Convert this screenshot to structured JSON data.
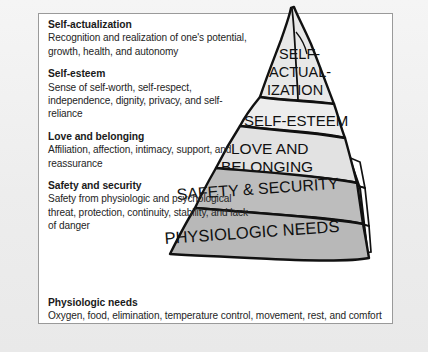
{
  "figure": {
    "needs": [
      {
        "title": "Self-actualization",
        "description": "Recognition and realization of one's potential, growth, health, and autonomy",
        "pyramid_label_lines": [
          "SELF-",
          "ACTUAL-",
          "IZATION"
        ],
        "tier_fill": "#e8e8e8"
      },
      {
        "title": "Self-esteem",
        "description": "Sense of self-worth, self-respect, independence, dignity, privacy, and self-reliance",
        "pyramid_label_lines": [
          "SELF-ESTEEM"
        ],
        "tier_fill": "#ededed"
      },
      {
        "title": "Love and belonging",
        "description": "Affiliation, affection, intimacy, support, and reassurance",
        "pyramid_label_lines": [
          "LOVE AND",
          "BELONGING"
        ],
        "tier_fill": "#e2e2e2"
      },
      {
        "title": "Safety and security",
        "description": "Safety from physiologic and psychological threat, protection, continuity, stability, and lack of danger",
        "pyramid_label_lines": [
          "SAFETY & SECURITY"
        ],
        "tier_fill": "#bdbdbd"
      },
      {
        "title": "Physiologic needs",
        "description": "Oxygen, food, elimination, temperature control, movement, rest, and comfort",
        "pyramid_label_lines": [
          "PHYSIOLOGIC NEEDS"
        ],
        "tier_fill": "#b8b8b8"
      }
    ],
    "colors": {
      "page_background": "#f2f2f2",
      "panel_background": "#ffffff",
      "panel_border": "#9a9a9a",
      "heading_text": "#1a1a1a",
      "body_text": "#252525",
      "pyramid_outline": "#111111",
      "pyramid_side_face": "#b0b0b0"
    }
  },
  "pyramid_labels": {
    "self_actualization_1": "SELF-",
    "self_actualization_2": "ACTUAL-",
    "self_actualization_3": "IZATION",
    "self_esteem": "SELF-ESTEEM",
    "love_1": "LOVE AND",
    "love_2": "BELONGING",
    "safety": "SAFETY & SECURITY",
    "physiologic": "PHYSIOLOGIC NEEDS"
  }
}
